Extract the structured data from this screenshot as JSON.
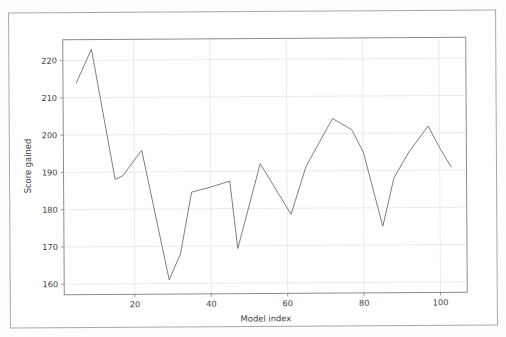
{
  "figure": {
    "background": "#ffffff",
    "page_border_color": "#a9a9ad",
    "axes_frame_color": "#8c8c90",
    "grid_color": "#e3e7ea",
    "line_color": "#6f7073",
    "tick_color": "#3d3d3f"
  },
  "chart_data": {
    "type": "line",
    "title": "",
    "xlabel": "Model index",
    "ylabel": "Score gained",
    "xlim": [
      1.5,
      107
    ],
    "ylim": [
      157.2,
      225.6
    ],
    "xticks": [
      20,
      40,
      60,
      80,
      100
    ],
    "yticks": [
      160,
      170,
      180,
      190,
      200,
      210,
      220
    ],
    "grid": true,
    "legend": null,
    "series": [
      {
        "name": "Score gained",
        "color": "#6f7073",
        "x": [
          5,
          9,
          15,
          17,
          22,
          29,
          32,
          35,
          40,
          45,
          47,
          53,
          61,
          65,
          72,
          77,
          80,
          85,
          88,
          92,
          97,
          100,
          103
        ],
        "y": [
          214.0,
          223.0,
          188.0,
          189.0,
          195.8,
          161.0,
          168.0,
          184.5,
          185.8,
          187.4,
          169.3,
          192.0,
          178.4,
          191.2,
          204.0,
          201.0,
          195.0,
          175.0,
          188.0,
          195.0,
          201.8,
          196.0,
          190.8
        ]
      }
    ]
  },
  "axis": {
    "x_tick_labels": [
      "20",
      "40",
      "60",
      "80",
      "100"
    ],
    "y_tick_labels": [
      "160",
      "170",
      "180",
      "190",
      "200",
      "210",
      "220"
    ],
    "x_axis_title": "Model index",
    "y_axis_title": "Score gained"
  }
}
